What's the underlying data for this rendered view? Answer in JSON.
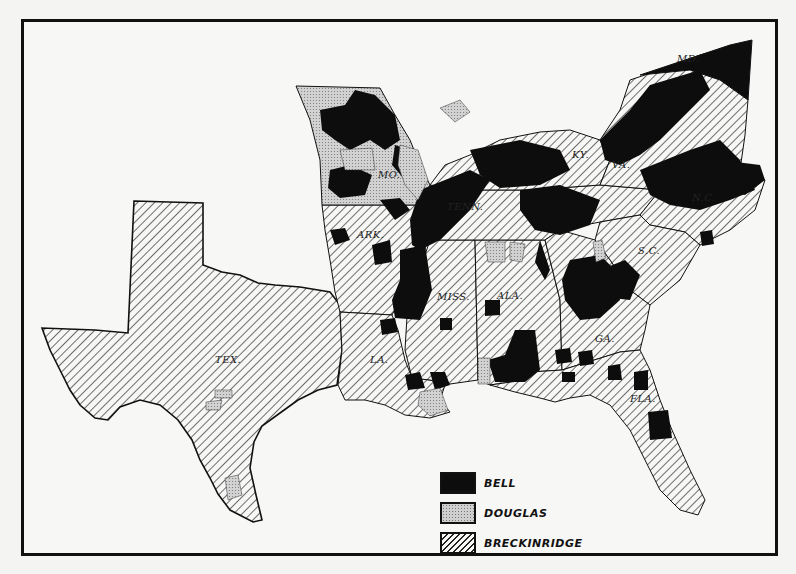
{
  "map": {
    "title": "",
    "states": [
      {
        "abbr": "MD."
      },
      {
        "abbr": "KY."
      },
      {
        "abbr": "VA."
      },
      {
        "abbr": "MO."
      },
      {
        "abbr": "TENN."
      },
      {
        "abbr": "N.C."
      },
      {
        "abbr": "ARK."
      },
      {
        "abbr": "S.C."
      },
      {
        "abbr": "MISS."
      },
      {
        "abbr": "ALA."
      },
      {
        "abbr": "GA."
      },
      {
        "abbr": "TEX."
      },
      {
        "abbr": "LA."
      },
      {
        "abbr": "FLA."
      }
    ],
    "colors": {
      "bell": "#0d0d0d",
      "douglas": "#cfcfcf",
      "breckinridge_hatch": "#222222",
      "background": "#f7f7f5"
    }
  },
  "legend": {
    "items": [
      {
        "key": "bell",
        "label": "BELL"
      },
      {
        "key": "douglas",
        "label": "DOUGLAS"
      },
      {
        "key": "breckinridge",
        "label": "BRECKINRIDGE"
      }
    ]
  }
}
